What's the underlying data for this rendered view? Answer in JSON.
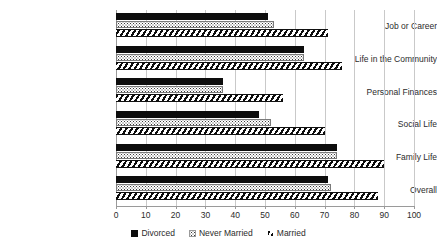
{
  "chart_data": {
    "type": "bar",
    "orientation": "horizontal",
    "title": "",
    "subtitle": "",
    "xlabel": "",
    "ylabel": "",
    "xlim": [
      0,
      100
    ],
    "xtick_step": 10,
    "xticks": [
      0,
      10,
      20,
      30,
      40,
      50,
      60,
      70,
      80,
      90,
      100
    ],
    "xtick_labels": [
      "0",
      "10",
      "20",
      "30",
      "40",
      "50",
      "60",
      "70",
      "80",
      "90",
      "100"
    ],
    "grid": true,
    "grid_axis": "x",
    "legend_position": "bottom",
    "categories": [
      "Job or Career",
      "Life in the Community",
      "Personal Finances",
      "Social Life",
      "Family Life",
      "Overall"
    ],
    "series": [
      {
        "name": "Divorced",
        "fill": "solid-black",
        "color": "#0d0d0d",
        "values": [
          51,
          63,
          36,
          48,
          74,
          71
        ]
      },
      {
        "name": "Never Married",
        "fill": "dotted",
        "color": "#3b3b3b",
        "values": [
          53,
          63,
          36,
          52,
          74,
          72
        ]
      },
      {
        "name": "Married",
        "fill": "diagonal-hatch",
        "color": "#0d0d0d",
        "values": [
          71,
          76,
          56,
          70,
          90,
          88
        ]
      }
    ]
  },
  "axis": {
    "grid_color": "#c9c9c9",
    "axis_color": "#9a9a9a",
    "text_color": "#2b2b2b"
  },
  "legend": {
    "entries": [
      {
        "label": "Divorced",
        "marker": "solid-square-icon"
      },
      {
        "label": "Never Married",
        "marker": "dotted-square-icon"
      },
      {
        "label": "Married",
        "marker": "hatched-square-icon"
      }
    ]
  }
}
